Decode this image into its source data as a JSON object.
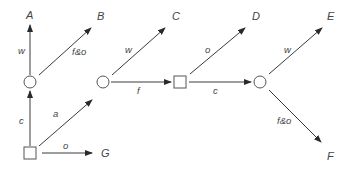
{
  "diagram": {
    "type": "state-transition-graph",
    "nodes": [
      {
        "id": "n1",
        "shape": "circle",
        "x": 30,
        "y": 82
      },
      {
        "id": "n2",
        "shape": "circle",
        "x": 103,
        "y": 82
      },
      {
        "id": "n3",
        "shape": "square",
        "x": 180,
        "y": 82
      },
      {
        "id": "n4",
        "shape": "circle",
        "x": 260,
        "y": 82
      },
      {
        "id": "n0",
        "shape": "square",
        "x": 30,
        "y": 153
      }
    ],
    "terminals": [
      {
        "id": "A",
        "label": "A",
        "x": 30,
        "y": 17
      },
      {
        "id": "B",
        "label": "B",
        "x": 101,
        "y": 18
      },
      {
        "id": "C",
        "label": "C",
        "x": 176,
        "y": 18
      },
      {
        "id": "D",
        "label": "D",
        "x": 256,
        "y": 18
      },
      {
        "id": "E",
        "label": "E",
        "x": 332,
        "y": 18
      },
      {
        "id": "F",
        "label": "F",
        "x": 330,
        "y": 158
      },
      {
        "id": "G",
        "label": "G",
        "x": 104,
        "y": 157
      }
    ],
    "edges": [
      {
        "from": "n0",
        "to": "n1",
        "label": "c"
      },
      {
        "from": "n0",
        "to": "n2",
        "label": "a"
      },
      {
        "from": "n0",
        "to": "G",
        "label": "o"
      },
      {
        "from": "n1",
        "to": "A",
        "label": "w"
      },
      {
        "from": "n1",
        "to": "B",
        "label": "f&o"
      },
      {
        "from": "n2",
        "to": "C",
        "label": "w"
      },
      {
        "from": "n2",
        "to": "n3",
        "label": "f"
      },
      {
        "from": "n3",
        "to": "D",
        "label": "o"
      },
      {
        "from": "n3",
        "to": "n4",
        "label": "c"
      },
      {
        "from": "n4",
        "to": "E",
        "label": "w"
      },
      {
        "from": "n4",
        "to": "F",
        "label": "f&o"
      }
    ]
  },
  "labels": {
    "A": "A",
    "B": "B",
    "C": "C",
    "D": "D",
    "E": "E",
    "F": "F",
    "G": "G",
    "e_c1": "c",
    "e_a": "a",
    "e_o1": "o",
    "e_w1": "w",
    "e_fo1": "f&o",
    "e_w2": "w",
    "e_f": "f",
    "e_o2": "o",
    "e_c2": "c",
    "e_w3": "w",
    "e_fo2": "f&o"
  },
  "colors": {
    "stroke": "#3a3a3a",
    "text": "#444444",
    "background": "#ffffff"
  }
}
